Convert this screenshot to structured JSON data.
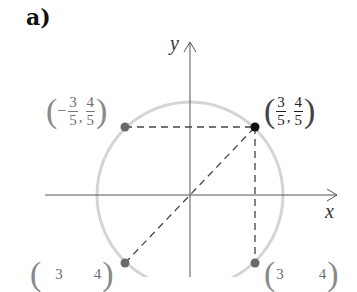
{
  "figure": {
    "part_label": "a)",
    "axes": {
      "x_label": "x",
      "y_label": "y"
    },
    "colors": {
      "circle": "#d4d4d4",
      "axis": "#555555",
      "dashed": "#444444",
      "primary_point": "#111111",
      "secondary_point": "#6a6a6a"
    },
    "points": [
      {
        "name": "q1",
        "label_x_num": "3",
        "label_x_den": "5",
        "label_x_sign": "",
        "label_y_num": "4",
        "label_y_den": "5",
        "label_y_sign": ""
      },
      {
        "name": "q2",
        "label_x_num": "3",
        "label_x_den": "5",
        "label_x_sign": "−",
        "label_y_num": "4",
        "label_y_den": "5",
        "label_y_sign": ""
      },
      {
        "name": "q3",
        "label_x_num": "3",
        "label_x_den": "",
        "label_y_num": "4",
        "label_y_den": ""
      },
      {
        "name": "q4",
        "label_x_num": "3",
        "label_x_den": "",
        "label_y_num": "4",
        "label_y_den": ""
      }
    ],
    "paren_open": "(",
    "paren_close": ")",
    "comma": ","
  }
}
